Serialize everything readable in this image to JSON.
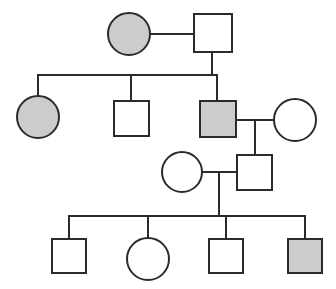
{
  "figure": {
    "kind": "pedigree-chart",
    "width": 336,
    "height": 289,
    "background_color": "#ffffff",
    "line_color": "#2b2b2b",
    "affected_fill_color": "#cccccc",
    "unaffected_fill_color": "#ffffff",
    "generations": 4
  },
  "legend_semantics": {
    "square": "male",
    "circle": "female",
    "filled": "affected",
    "unfilled": "unaffected"
  },
  "individuals": [
    {
      "id": "I-1",
      "generation": 1,
      "shape": "circle",
      "sex": "female",
      "status": "affected",
      "filled": true,
      "fill": "#cccccc",
      "cx": 129,
      "cy": 34,
      "r": 21
    },
    {
      "id": "I-2",
      "generation": 1,
      "shape": "square",
      "sex": "male",
      "status": "unaffected",
      "filled": false,
      "fill": "#ffffff",
      "x": 194,
      "y": 14,
      "size": 38
    },
    {
      "id": "II-1",
      "generation": 2,
      "shape": "circle",
      "sex": "female",
      "status": "affected",
      "filled": true,
      "fill": "#cccccc",
      "cx": 38,
      "cy": 117,
      "r": 21
    },
    {
      "id": "II-2",
      "generation": 2,
      "shape": "square",
      "sex": "male",
      "status": "unaffected",
      "filled": false,
      "fill": "#ffffff",
      "x": 114,
      "y": 101,
      "size": 35
    },
    {
      "id": "II-3",
      "generation": 2,
      "shape": "square",
      "sex": "male",
      "status": "affected",
      "filled": true,
      "fill": "#cccccc",
      "x": 200,
      "y": 101,
      "size": 36
    },
    {
      "id": "II-4",
      "generation": 2,
      "shape": "circle",
      "sex": "female",
      "status": "unaffected",
      "filled": false,
      "fill": "#ffffff",
      "cx": 295,
      "cy": 120,
      "r": 21
    },
    {
      "id": "III-1",
      "generation": 3,
      "shape": "circle",
      "sex": "female",
      "status": "unaffected",
      "filled": false,
      "fill": "#ffffff",
      "cx": 182,
      "cy": 172,
      "r": 20
    },
    {
      "id": "III-2",
      "generation": 3,
      "shape": "square",
      "sex": "male",
      "status": "unaffected",
      "filled": false,
      "fill": "#ffffff",
      "x": 237,
      "y": 155,
      "size": 35
    },
    {
      "id": "IV-1",
      "generation": 4,
      "shape": "square",
      "sex": "male",
      "status": "unaffected",
      "filled": false,
      "fill": "#ffffff",
      "x": 52,
      "y": 239,
      "size": 34
    },
    {
      "id": "IV-2",
      "generation": 4,
      "shape": "circle",
      "sex": "female",
      "status": "unaffected",
      "filled": false,
      "fill": "#ffffff",
      "cx": 148,
      "cy": 259,
      "r": 21
    },
    {
      "id": "IV-3",
      "generation": 4,
      "shape": "square",
      "sex": "male",
      "status": "unaffected",
      "filled": false,
      "fill": "#ffffff",
      "x": 209,
      "y": 239,
      "size": 34
    },
    {
      "id": "IV-4",
      "generation": 4,
      "shape": "square",
      "sex": "male",
      "status": "affected",
      "filled": true,
      "fill": "#cccccc",
      "x": 288,
      "y": 239,
      "size": 34
    }
  ],
  "matings": [
    {
      "id": "mating-1",
      "partners": [
        "I-1",
        "I-2"
      ],
      "line_y": 34,
      "line_x1": 150,
      "line_x2": 194,
      "drop_x": 212,
      "drop_y2": 75
    },
    {
      "id": "mating-2",
      "partners": [
        "II-3",
        "II-4"
      ],
      "line_y": 120,
      "line_x1": 236,
      "line_x2": 274,
      "drop_x": 255,
      "drop_y2": 172
    },
    {
      "id": "mating-3",
      "partners": [
        "III-1",
        "III-2"
      ],
      "line_y": 172,
      "line_x1": 202,
      "line_x2": 237,
      "drop_x": 219,
      "drop_y2": 216
    }
  ],
  "sibships": [
    {
      "id": "sibship-1",
      "parents": "mating-1",
      "children": [
        "II-1",
        "II-2",
        "II-3"
      ],
      "bar_y": 75,
      "bar_x1": 38,
      "bar_x2": 217,
      "stems": [
        {
          "x": 38,
          "y2": 96
        },
        {
          "x": 131,
          "y2": 101
        },
        {
          "x": 217,
          "y2": 101
        }
      ]
    },
    {
      "id": "sibship-2",
      "parents": "mating-3",
      "children": [
        "IV-1",
        "IV-2",
        "IV-3",
        "IV-4"
      ],
      "bar_y": 216,
      "bar_x1": 69,
      "bar_x2": 305,
      "stems": [
        {
          "x": 69,
          "y2": 239
        },
        {
          "x": 148,
          "y2": 238
        },
        {
          "x": 226,
          "y2": 239
        },
        {
          "x": 305,
          "y2": 239
        }
      ]
    }
  ]
}
